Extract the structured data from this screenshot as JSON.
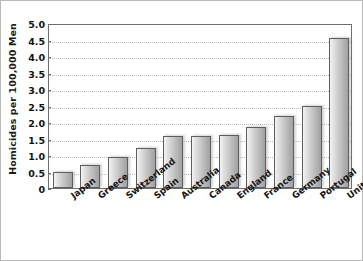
{
  "chart_data": {
    "type": "bar",
    "title": "",
    "subtitle": "",
    "xlabel": "",
    "ylabel": "Homicides per 100,000 Men",
    "ylim": [
      0,
      5.0
    ],
    "ytick_labels": [
      "5.0",
      "4.5",
      "4.0",
      "3.5",
      "3.0",
      "2.5",
      "2.0",
      "1.5",
      "1.0",
      "0.5",
      "0"
    ],
    "ytick_values": [
      5.0,
      4.5,
      4.0,
      3.5,
      3.0,
      2.5,
      2.0,
      1.5,
      1.0,
      0.5,
      0
    ],
    "grid": true,
    "grid_axis": "y",
    "legend": false,
    "legend_position": "none",
    "categories": [
      "Japan",
      "Greece",
      "Switzerland",
      "Spain",
      "Australia",
      "Canada",
      "England",
      "France",
      "Germany",
      "Portugal",
      "United States"
    ],
    "values": [
      0.5,
      0.7,
      0.95,
      1.2,
      1.57,
      1.58,
      1.6,
      1.85,
      2.17,
      2.48,
      4.55
    ],
    "bar_color": "#c6c6c6",
    "bar_edge_color": "#5d5d5d",
    "grid_color": "#bdbdbd",
    "axis_color": "#6e6e6e",
    "text_color": "#111111",
    "background_color": "#ffffff"
  }
}
